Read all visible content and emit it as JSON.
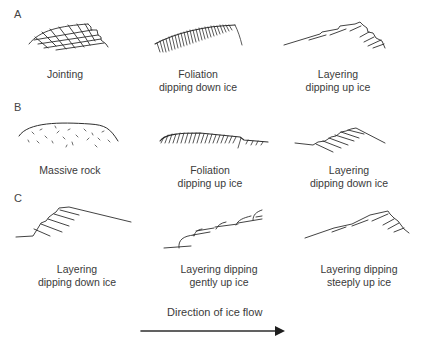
{
  "rows": [
    {
      "label": "A",
      "panels": [
        {
          "caption_lines": [
            "Jointing"
          ]
        },
        {
          "caption_lines": [
            "Foliation",
            "dipping down ice"
          ]
        },
        {
          "caption_lines": [
            "Layering",
            "dipping up ice"
          ]
        }
      ]
    },
    {
      "label": "B",
      "panels": [
        {
          "caption_lines": [
            "Massive rock"
          ]
        },
        {
          "caption_lines": [
            "Foliation",
            "dipping up ice"
          ]
        },
        {
          "caption_lines": [
            "Layering",
            "dipping down ice"
          ]
        }
      ]
    },
    {
      "label": "C",
      "panels": [
        {
          "caption_lines": [
            "Layering",
            "dipping down ice"
          ]
        },
        {
          "caption_lines": [
            "Layering dipping",
            "gently up ice"
          ]
        },
        {
          "caption_lines": [
            "Layering dipping",
            "steeply up ice"
          ]
        }
      ]
    }
  ],
  "legend": {
    "arrow_label": "Direction of ice flow",
    "arrow_direction": "right"
  },
  "colors": {
    "stroke": "#2e2e2e",
    "text": "#3a3a3a",
    "background": "#ffffff"
  }
}
